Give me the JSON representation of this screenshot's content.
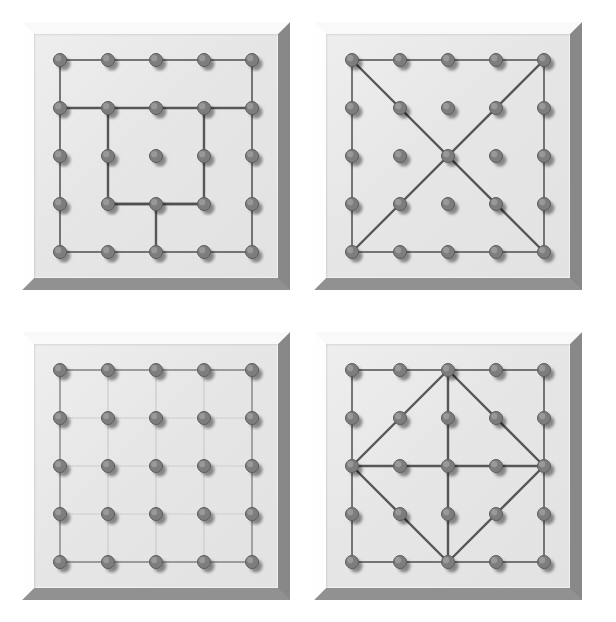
{
  "figure": {
    "kind": "geoboard-set",
    "columns": 2,
    "rows": 2,
    "grid_size": 5,
    "board_count": 4
  },
  "colors": {
    "band_dark": "#4f4f4f",
    "band_light": "#c9c9c9",
    "peg_fill": "#7d7d7d",
    "peg_edge": "#5d5d5d",
    "peg_shadow": "rgba(90,90,90,0.38)",
    "board_face": "#e8e8e8",
    "frame_light": "#fbfbfb",
    "frame_dark": "#8d8d8d",
    "page_background": "#ffffff"
  },
  "geometry": {
    "board_px": 268,
    "face_px": 244,
    "frame_px": 12,
    "peg_radius": 6.5,
    "band_width_dark": 2.4,
    "band_width_outline": 1.5,
    "band_width_light": 1.2,
    "cell": 48,
    "origin": 26,
    "positions": [
      {
        "left": 22,
        "top": 22
      },
      {
        "left": 314,
        "top": 22
      },
      {
        "left": 22,
        "top": 332
      },
      {
        "left": 314,
        "top": 332
      }
    ]
  },
  "boards": [
    {
      "id": "board-1",
      "name": "stepped-rectilinear-figure",
      "label": "Geoboard 1",
      "paths": [
        {
          "name": "outer-perimeter",
          "style": "outline",
          "closed": true,
          "points": [
            [
              0,
              0
            ],
            [
              4,
              0
            ],
            [
              4,
              4
            ],
            [
              0,
              4
            ]
          ]
        },
        {
          "name": "horizontal-band-row-1",
          "style": "dark",
          "closed": false,
          "points": [
            [
              0,
              1
            ],
            [
              4,
              1
            ]
          ]
        },
        {
          "name": "inner-rectangle",
          "style": "dark",
          "closed": false,
          "points": [
            [
              1,
              1
            ],
            [
              1,
              3
            ],
            [
              3,
              3
            ],
            [
              3,
              1
            ]
          ]
        },
        {
          "name": "stem-to-bottom-edge",
          "style": "dark",
          "closed": false,
          "points": [
            [
              2,
              3
            ],
            [
              2,
              4
            ]
          ]
        },
        {
          "name": "bottom-row-segment",
          "style": "dark",
          "closed": false,
          "points": [
            [
              1,
              3
            ],
            [
              3,
              3
            ]
          ]
        }
      ]
    },
    {
      "id": "board-2",
      "name": "square-with-both-diagonals",
      "label": "Geoboard 2",
      "paths": [
        {
          "name": "outer-perimeter",
          "style": "outline",
          "closed": true,
          "points": [
            [
              0,
              0
            ],
            [
              4,
              0
            ],
            [
              4,
              4
            ],
            [
              0,
              4
            ]
          ]
        },
        {
          "name": "diagonal-top-left-to-bottom-right",
          "style": "dark",
          "closed": false,
          "points": [
            [
              0,
              0
            ],
            [
              4,
              4
            ]
          ]
        },
        {
          "name": "diagonal-bottom-left-to-top-right",
          "style": "dark",
          "closed": false,
          "points": [
            [
              0,
              4
            ],
            [
              4,
              0
            ]
          ]
        }
      ]
    },
    {
      "id": "board-3",
      "name": "full-unit-grid",
      "label": "Geoboard 3",
      "paths": [
        {
          "name": "outer-perimeter",
          "style": "outline",
          "closed": true,
          "points": [
            [
              0,
              0
            ],
            [
              4,
              0
            ],
            [
              4,
              4
            ],
            [
              0,
              4
            ]
          ]
        },
        {
          "name": "grid-row-0",
          "style": "light",
          "closed": false,
          "points": [
            [
              0,
              0
            ],
            [
              4,
              0
            ]
          ]
        },
        {
          "name": "grid-row-1",
          "style": "light",
          "closed": false,
          "points": [
            [
              0,
              1
            ],
            [
              4,
              1
            ]
          ]
        },
        {
          "name": "grid-row-2",
          "style": "light",
          "closed": false,
          "points": [
            [
              0,
              2
            ],
            [
              4,
              2
            ]
          ]
        },
        {
          "name": "grid-row-3",
          "style": "light",
          "closed": false,
          "points": [
            [
              0,
              3
            ],
            [
              4,
              3
            ]
          ]
        },
        {
          "name": "grid-row-4",
          "style": "light",
          "closed": false,
          "points": [
            [
              0,
              4
            ],
            [
              4,
              4
            ]
          ]
        },
        {
          "name": "grid-col-0",
          "style": "light",
          "closed": false,
          "points": [
            [
              0,
              0
            ],
            [
              0,
              4
            ]
          ]
        },
        {
          "name": "grid-col-1",
          "style": "light",
          "closed": false,
          "points": [
            [
              1,
              0
            ],
            [
              1,
              4
            ]
          ]
        },
        {
          "name": "grid-col-2",
          "style": "light",
          "closed": false,
          "points": [
            [
              2,
              0
            ],
            [
              2,
              4
            ]
          ]
        },
        {
          "name": "grid-col-3",
          "style": "light",
          "closed": false,
          "points": [
            [
              3,
              0
            ],
            [
              3,
              4
            ]
          ]
        },
        {
          "name": "grid-col-4",
          "style": "light",
          "closed": false,
          "points": [
            [
              4,
              0
            ],
            [
              4,
              4
            ]
          ]
        }
      ]
    },
    {
      "id": "board-4",
      "name": "inscribed-diamond-with-axes",
      "label": "Geoboard 4",
      "paths": [
        {
          "name": "outer-perimeter",
          "style": "outline",
          "closed": true,
          "points": [
            [
              0,
              0
            ],
            [
              4,
              0
            ],
            [
              4,
              4
            ],
            [
              0,
              4
            ]
          ]
        },
        {
          "name": "inscribed-diamond",
          "style": "dark",
          "closed": true,
          "points": [
            [
              2,
              0
            ],
            [
              4,
              2
            ],
            [
              2,
              4
            ],
            [
              0,
              2
            ]
          ]
        },
        {
          "name": "horizontal-midline",
          "style": "dark",
          "closed": false,
          "points": [
            [
              0,
              2
            ],
            [
              4,
              2
            ]
          ]
        },
        {
          "name": "vertical-midline",
          "style": "dark",
          "closed": false,
          "points": [
            [
              2,
              0
            ],
            [
              2,
              4
            ]
          ]
        }
      ]
    }
  ]
}
